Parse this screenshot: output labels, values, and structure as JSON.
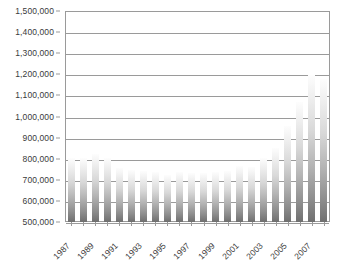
{
  "chart_data": {
    "type": "bar",
    "title": "",
    "subtitle": "",
    "xlabel": "",
    "ylabel": "",
    "ylim": [
      500000,
      1500000
    ],
    "ytick_step": 100000,
    "grid": true,
    "legend": null,
    "legend_position": "none",
    "bar_style": "vertical-gradient-gray",
    "ytick_labels": [
      "1,500,000",
      "1,400,000",
      "1,300,000",
      "1,200,000",
      "1,100,000",
      "1,000,000",
      "900,000",
      "800,000",
      "700,000",
      "600,000",
      "500,000"
    ],
    "ytick_values": [
      1500000,
      1400000,
      1300000,
      1200000,
      1100000,
      1000000,
      900000,
      800000,
      700000,
      600000,
      500000
    ],
    "categories": [
      "1987",
      "1988",
      "1989",
      "1990",
      "1991",
      "1992",
      "1993",
      "1994",
      "1995",
      "1996",
      "1997",
      "1998",
      "1999",
      "2000",
      "2001",
      "2002",
      "2003",
      "2004",
      "2005",
      "2006",
      "2007",
      "2008"
    ],
    "xtick_labels_shown": [
      "1987",
      "1989",
      "1991",
      "1993",
      "1995",
      "1997",
      "1999",
      "2001",
      "2003",
      "2005",
      "2007"
    ],
    "values": [
      805000,
      805000,
      820000,
      805000,
      755000,
      745000,
      740000,
      735000,
      725000,
      735000,
      730000,
      730000,
      735000,
      740000,
      765000,
      760000,
      805000,
      850000,
      955000,
      1070000,
      1195000,
      1180000
    ]
  },
  "axis": {
    "y_line_color": "#9a9a9a",
    "grid_color": "#9a9a9a",
    "bar_top_color": "#fdfdfd",
    "bar_bottom_color": "#6f6f6f",
    "background": "#ffffff",
    "text_color": "#3a3a3a"
  }
}
